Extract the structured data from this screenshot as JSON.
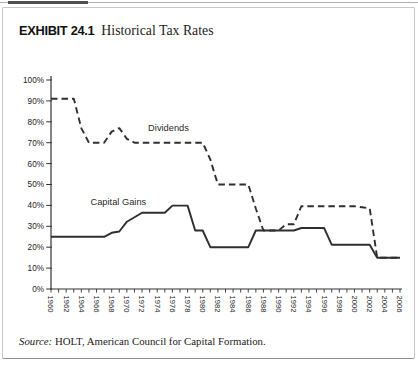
{
  "exhibit": {
    "label": "EXHIBIT 24.1",
    "title": "Historical Tax Rates"
  },
  "source": {
    "prefix": "Source:",
    "text": " HOLT, American Council for Capital Formation."
  },
  "chart_data": {
    "type": "line",
    "title": "Historical Tax Rates",
    "x": [
      1960,
      1961,
      1962,
      1963,
      1964,
      1965,
      1966,
      1967,
      1968,
      1969,
      1970,
      1971,
      1972,
      1973,
      1974,
      1975,
      1976,
      1977,
      1978,
      1979,
      1980,
      1981,
      1982,
      1983,
      1984,
      1985,
      1986,
      1987,
      1988,
      1989,
      1990,
      1991,
      1992,
      1993,
      1994,
      1995,
      1996,
      1997,
      1998,
      1999,
      2000,
      2001,
      2002,
      2003,
      2004,
      2005,
      2006
    ],
    "series": [
      {
        "name": "Dividends",
        "line_style": "dashed",
        "values": [
          91,
          91,
          91,
          91,
          77,
          70,
          70,
          70,
          75.3,
          77,
          71.8,
          70,
          70,
          70,
          70,
          70,
          70,
          70,
          70,
          70,
          70,
          62,
          50,
          50,
          50,
          50,
          50,
          38.5,
          28,
          28,
          28,
          31,
          31,
          39.6,
          39.6,
          39.6,
          39.6,
          39.6,
          39.6,
          39.6,
          39.6,
          39.1,
          38.6,
          15,
          15,
          15,
          15
        ]
      },
      {
        "name": "Capital Gains",
        "line_style": "solid",
        "values": [
          25,
          25,
          25,
          25,
          25,
          25,
          25,
          25,
          26.9,
          27.5,
          32.2,
          34.3,
          36.5,
          36.5,
          36.5,
          36.5,
          39.9,
          39.9,
          39.9,
          28,
          28,
          20,
          20,
          20,
          20,
          20,
          20,
          28,
          28,
          28,
          28,
          28,
          28,
          29.2,
          29.2,
          29.2,
          29.2,
          21.2,
          21.2,
          21.2,
          21.2,
          21.2,
          21.2,
          15,
          15,
          15,
          15
        ]
      }
    ],
    "y_axis": {
      "min": 0,
      "max": 100,
      "tick_step": 10,
      "tick_labels": [
        "0%",
        "10%",
        "20%",
        "30%",
        "40%",
        "50%",
        "60%",
        "70%",
        "80%",
        "90%",
        "100%"
      ]
    },
    "x_axis": {
      "minor_tick_every_years": 1,
      "label_every_years": 2,
      "tick_labels": [
        "1960",
        "1962",
        "1964",
        "1966",
        "1968",
        "1970",
        "1972",
        "1974",
        "1976",
        "1978",
        "1980",
        "1982",
        "1984",
        "1986",
        "1988",
        "1990",
        "1992",
        "1994",
        "1996",
        "1998",
        "2000",
        "2002",
        "2004",
        "2006"
      ]
    },
    "annotations": [
      {
        "text": "Dividends",
        "year": 1972.8,
        "value": 75.7
      },
      {
        "text": "Capital Gains",
        "year": 1965.2,
        "value": 40.3
      }
    ],
    "grid": "off",
    "legend": "inline-labels",
    "colors": {
      "line": "#2f2f2f",
      "axis": "#333333",
      "text": "#1a1a1a"
    }
  }
}
